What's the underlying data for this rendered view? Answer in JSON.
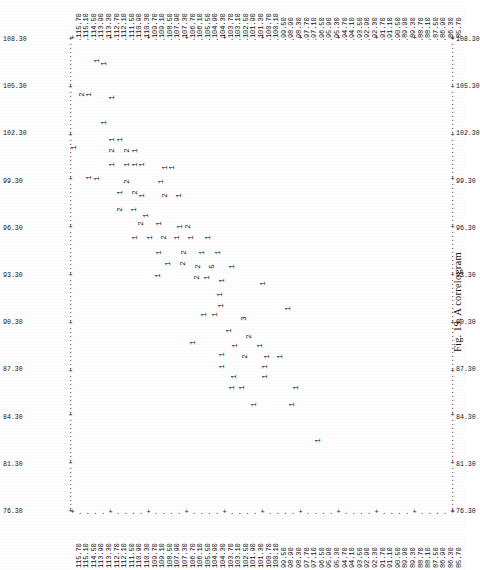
{
  "figure": {
    "caption": "Fig. 19. A correlogram",
    "type": "character-printout-scatter"
  },
  "axes": {
    "column_labels": [
      "115.70",
      "115.10",
      "114.50",
      "113.90",
      "113.30",
      "112.70",
      "112.10",
      "111.50",
      "110.90",
      "110.30",
      "109.70",
      "109.10",
      "108.50",
      "107.90",
      "107.30",
      "106.70",
      "106.10",
      "105.50",
      "104.90",
      "104.30",
      "103.70",
      "103.10",
      "102.50",
      "101.90",
      "101.30",
      "100.70",
      "100.10",
      "99.50",
      "98.90",
      "98.30",
      "97.70",
      "97.10",
      "96.50",
      "95.90",
      "95.30",
      "94.70",
      "94.10",
      "93.50",
      "92.90",
      "92.30",
      "91.70",
      "91.10",
      "90.50",
      "89.90",
      "89.30",
      "88.70",
      "88.10",
      "87.50",
      "86.90",
      "86.30",
      "85.70"
    ],
    "row_labels": [
      "108.30",
      "105.30",
      "102.30",
      "99.30",
      "96.30",
      "93.30",
      "90.30",
      "87.30",
      "84.30",
      "81.30",
      "76.30"
    ],
    "row_labels_right": [
      "108.30",
      "105.30",
      "102.30",
      "99.30",
      "96.30",
      "93.30",
      "90.30",
      "87.30",
      "84.30",
      "81.30",
      "76.30"
    ]
  },
  "chart_data": {
    "type": "scatter",
    "title": "Fig. 19. A correlogram",
    "xlabel": "",
    "ylabel": "",
    "xlim": [
      85.7,
      115.7
    ],
    "ylim": [
      76.3,
      109.8
    ],
    "grid": false,
    "legend": "none",
    "glyph_counts": {
      "1": 74,
      "2": 26,
      "3": 2,
      "5": 1
    },
    "points": [
      {
        "x": 113.9,
        "y": 108.6,
        "n": 1
      },
      {
        "x": 113.3,
        "y": 108.4,
        "n": 1
      },
      {
        "x": 115.1,
        "y": 106.2,
        "n": 2
      },
      {
        "x": 114.5,
        "y": 106.2,
        "n": 1
      },
      {
        "x": 112.7,
        "y": 106.0,
        "n": 1
      },
      {
        "x": 113.3,
        "y": 104.2,
        "n": 1
      },
      {
        "x": 112.7,
        "y": 103.0,
        "n": 1
      },
      {
        "x": 112.1,
        "y": 103.0,
        "n": 1
      },
      {
        "x": 115.7,
        "y": 102.4,
        "n": 1
      },
      {
        "x": 112.7,
        "y": 102.2,
        "n": 2
      },
      {
        "x": 111.5,
        "y": 102.2,
        "n": 2
      },
      {
        "x": 110.9,
        "y": 102.2,
        "n": 1
      },
      {
        "x": 112.7,
        "y": 101.2,
        "n": 1
      },
      {
        "x": 111.5,
        "y": 101.2,
        "n": 1
      },
      {
        "x": 110.9,
        "y": 101.2,
        "n": 1
      },
      {
        "x": 110.3,
        "y": 101.2,
        "n": 1
      },
      {
        "x": 108.5,
        "y": 101.0,
        "n": 1
      },
      {
        "x": 108.0,
        "y": 101.0,
        "n": 1
      },
      {
        "x": 114.5,
        "y": 100.3,
        "n": 1
      },
      {
        "x": 113.9,
        "y": 100.2,
        "n": 1
      },
      {
        "x": 111.5,
        "y": 100.0,
        "n": 2
      },
      {
        "x": 108.8,
        "y": 100.0,
        "n": 1
      },
      {
        "x": 112.1,
        "y": 99.2,
        "n": 1
      },
      {
        "x": 110.9,
        "y": 99.2,
        "n": 2
      },
      {
        "x": 110.3,
        "y": 99.0,
        "n": 1
      },
      {
        "x": 108.5,
        "y": 99.0,
        "n": 2
      },
      {
        "x": 107.4,
        "y": 99.0,
        "n": 1
      },
      {
        "x": 112.1,
        "y": 98.0,
        "n": 2
      },
      {
        "x": 111.0,
        "y": 98.0,
        "n": 1
      },
      {
        "x": 110.0,
        "y": 97.6,
        "n": 1
      },
      {
        "x": 110.4,
        "y": 97.0,
        "n": 2
      },
      {
        "x": 109.0,
        "y": 97.0,
        "n": 1
      },
      {
        "x": 107.3,
        "y": 96.8,
        "n": 1
      },
      {
        "x": 106.7,
        "y": 96.8,
        "n": 2
      },
      {
        "x": 110.9,
        "y": 96.0,
        "n": 1
      },
      {
        "x": 109.7,
        "y": 96.0,
        "n": 1
      },
      {
        "x": 108.6,
        "y": 96.0,
        "n": 2
      },
      {
        "x": 107.6,
        "y": 96.0,
        "n": 1
      },
      {
        "x": 106.5,
        "y": 96.0,
        "n": 1
      },
      {
        "x": 105.1,
        "y": 96.0,
        "n": 1
      },
      {
        "x": 109.0,
        "y": 95.0,
        "n": 1
      },
      {
        "x": 107.0,
        "y": 95.0,
        "n": 2
      },
      {
        "x": 105.6,
        "y": 95.0,
        "n": 1
      },
      {
        "x": 104.3,
        "y": 95.0,
        "n": 1
      },
      {
        "x": 108.3,
        "y": 94.2,
        "n": 1
      },
      {
        "x": 107.1,
        "y": 94.2,
        "n": 2
      },
      {
        "x": 105.9,
        "y": 94.0,
        "n": 2
      },
      {
        "x": 104.8,
        "y": 94.0,
        "n": 5
      },
      {
        "x": 103.2,
        "y": 94.0,
        "n": 1
      },
      {
        "x": 109.1,
        "y": 93.3,
        "n": 1
      },
      {
        "x": 106.0,
        "y": 93.2,
        "n": 2
      },
      {
        "x": 105.2,
        "y": 93.2,
        "n": 1
      },
      {
        "x": 104.0,
        "y": 93.0,
        "n": 1
      },
      {
        "x": 100.8,
        "y": 92.8,
        "n": 1
      },
      {
        "x": 104.2,
        "y": 92.0,
        "n": 1
      },
      {
        "x": 104.1,
        "y": 91.2,
        "n": 1
      },
      {
        "x": 98.8,
        "y": 91.0,
        "n": 1
      },
      {
        "x": 105.4,
        "y": 90.6,
        "n": 1
      },
      {
        "x": 104.6,
        "y": 90.6,
        "n": 1
      },
      {
        "x": 102.3,
        "y": 90.3,
        "n": 3
      },
      {
        "x": 103.5,
        "y": 89.4,
        "n": 1
      },
      {
        "x": 101.9,
        "y": 89.0,
        "n": 2
      },
      {
        "x": 106.3,
        "y": 88.6,
        "n": 1
      },
      {
        "x": 103.0,
        "y": 88.4,
        "n": 1
      },
      {
        "x": 101.0,
        "y": 88.4,
        "n": 1
      },
      {
        "x": 104.0,
        "y": 87.7,
        "n": 1
      },
      {
        "x": 102.2,
        "y": 87.6,
        "n": 2
      },
      {
        "x": 100.5,
        "y": 87.6,
        "n": 1
      },
      {
        "x": 99.4,
        "y": 87.6,
        "n": 1
      },
      {
        "x": 104.0,
        "y": 86.9,
        "n": 1
      },
      {
        "x": 100.6,
        "y": 86.9,
        "n": 1
      },
      {
        "x": 103.1,
        "y": 86.2,
        "n": 1
      },
      {
        "x": 100.6,
        "y": 86.2,
        "n": 1
      },
      {
        "x": 103.2,
        "y": 85.4,
        "n": 1
      },
      {
        "x": 102.4,
        "y": 85.4,
        "n": 1
      },
      {
        "x": 98.2,
        "y": 85.4,
        "n": 1
      },
      {
        "x": 101.5,
        "y": 84.2,
        "n": 1
      },
      {
        "x": 98.5,
        "y": 84.2,
        "n": 1
      },
      {
        "x": 96.4,
        "y": 81.6,
        "n": 1
      }
    ]
  },
  "frame": {
    "tick_marker": "+",
    "fill_marker": "."
  }
}
